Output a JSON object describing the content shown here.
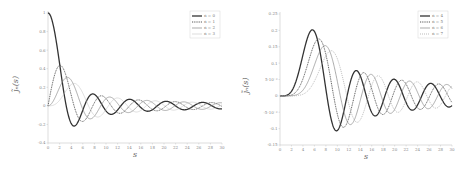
{
  "chart_data": [
    {
      "type": "line",
      "title": "",
      "xlabel": "s",
      "ylabel": "j̃_n(s)",
      "xlim": [
        0,
        30
      ],
      "ylim": [
        -0.4,
        1
      ],
      "xticks": [
        "0",
        "2",
        "4",
        "6",
        "8",
        "10",
        "12",
        "14",
        "16",
        "18",
        "20",
        "22",
        "24",
        "26",
        "28",
        "30"
      ],
      "yticks": [
        "-0.4",
        "-0.2",
        "0",
        "0.2",
        "0.4",
        "0.6",
        "0.8",
        "1"
      ],
      "grid": false,
      "legend_position": "upper right",
      "series": [
        {
          "name": "n = 0",
          "order": 0,
          "style": "solid-thick",
          "color": "#333333"
        },
        {
          "name": "n = 1",
          "order": 1,
          "style": "dotted",
          "color": "#555555"
        },
        {
          "name": "n = 2",
          "order": 2,
          "style": "solid",
          "color": "#888888"
        },
        {
          "name": "n = 3",
          "order": 3,
          "style": "solid-thin",
          "color": "#bbbbbb"
        }
      ],
      "sample_points": {
        "x": [
          0,
          2,
          4,
          4.5,
          6,
          8,
          10,
          12,
          14,
          20,
          30
        ],
        "n0": [
          1.0,
          0.45,
          -0.19,
          -0.22,
          -0.05,
          0.12,
          -0.05,
          -0.04,
          0.07,
          0.05,
          -0.03
        ]
      }
    },
    {
      "type": "line",
      "title": "",
      "xlabel": "s",
      "ylabel": "j̃_n(s)",
      "xlim": [
        0,
        30
      ],
      "ylim": [
        -0.15,
        0.25
      ],
      "xticks": [
        "0",
        "2",
        "4",
        "6",
        "8",
        "10",
        "12",
        "14",
        "16",
        "18",
        "20",
        "22",
        "24",
        "26",
        "28",
        "30"
      ],
      "yticks": [
        "-0.15",
        "-0.1",
        "-5·10⁻²",
        "0",
        "5·10⁻²",
        "0.1",
        "0.15",
        "0.2",
        "0.25"
      ],
      "grid": false,
      "legend_position": "upper right",
      "series": [
        {
          "name": "n = 4",
          "order": 4,
          "style": "solid-thick",
          "color": "#333333"
        },
        {
          "name": "n = 5",
          "order": 5,
          "style": "dotted",
          "color": "#555555"
        },
        {
          "name": "n = 6",
          "order": 6,
          "style": "solid",
          "color": "#888888"
        },
        {
          "name": "n = 7",
          "order": 7,
          "style": "dotted-thin",
          "color": "#aaaaaa"
        }
      ],
      "sample_points": {
        "x": [
          0,
          4,
          6,
          10,
          13,
          16,
          20,
          26,
          30
        ],
        "n4": [
          0,
          0.09,
          0.2,
          -0.11,
          0.07,
          -0.06,
          0.05,
          0.04,
          -0.03
        ]
      }
    }
  ]
}
